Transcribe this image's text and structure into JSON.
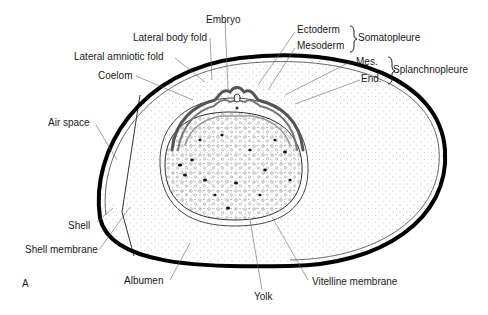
{
  "figure": {
    "panel_letter": "A"
  },
  "labels": {
    "embryo": "Embryo",
    "lateral_body_fold": "Lateral body fold",
    "lateral_amniotic_fold": "Lateral amniotic fold",
    "coelom": "Coelom",
    "air_space": "Air space",
    "shell": "Shell",
    "shell_membrane": "Shell membrane",
    "albumen": "Albumen",
    "yolk": "Yolk",
    "vitelline_membrane": "Vitelline membrane",
    "ectoderm": "Ectoderm",
    "mesoderm": "Mesoderm",
    "somatopleure": "Somatopleure",
    "mes": "Mes.",
    "end": "End.",
    "splanchnopleure": "Splanchnopleure"
  },
  "colors": {
    "shell": "#000000",
    "line": "#333333",
    "stipple": "#555555",
    "background": "#ffffff"
  }
}
